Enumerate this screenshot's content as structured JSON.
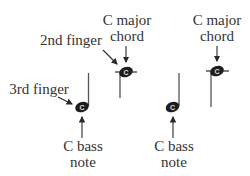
{
  "diagram": {
    "title": "",
    "colors": {
      "ink": "#2a2a2a",
      "text": "#333333",
      "note_letter": "#dddddd",
      "background": "#ffffff"
    },
    "labels": {
      "chord_left": {
        "line1": "C major",
        "line2": "chord"
      },
      "chord_right": {
        "line1": "C major",
        "line2": "chord"
      },
      "second_finger": "2nd finger",
      "third_finger": "3rd finger",
      "bass_left": {
        "line1": "C bass",
        "line2": "note"
      },
      "bass_right": {
        "line1": "C bass",
        "line2": "note"
      }
    },
    "notes": [
      {
        "id": "bass-left",
        "letter": "C",
        "role": "C bass note",
        "stem": "up",
        "finger": "3rd finger"
      },
      {
        "id": "chord-left",
        "letter": "C",
        "role": "C major chord",
        "stem": "down",
        "finger": "2nd finger",
        "ledger_line": true
      },
      {
        "id": "bass-right",
        "letter": "C",
        "role": "C bass note",
        "stem": "up"
      },
      {
        "id": "chord-right",
        "letter": "C",
        "role": "C major chord",
        "stem": "down",
        "ledger_line": true
      }
    ]
  }
}
